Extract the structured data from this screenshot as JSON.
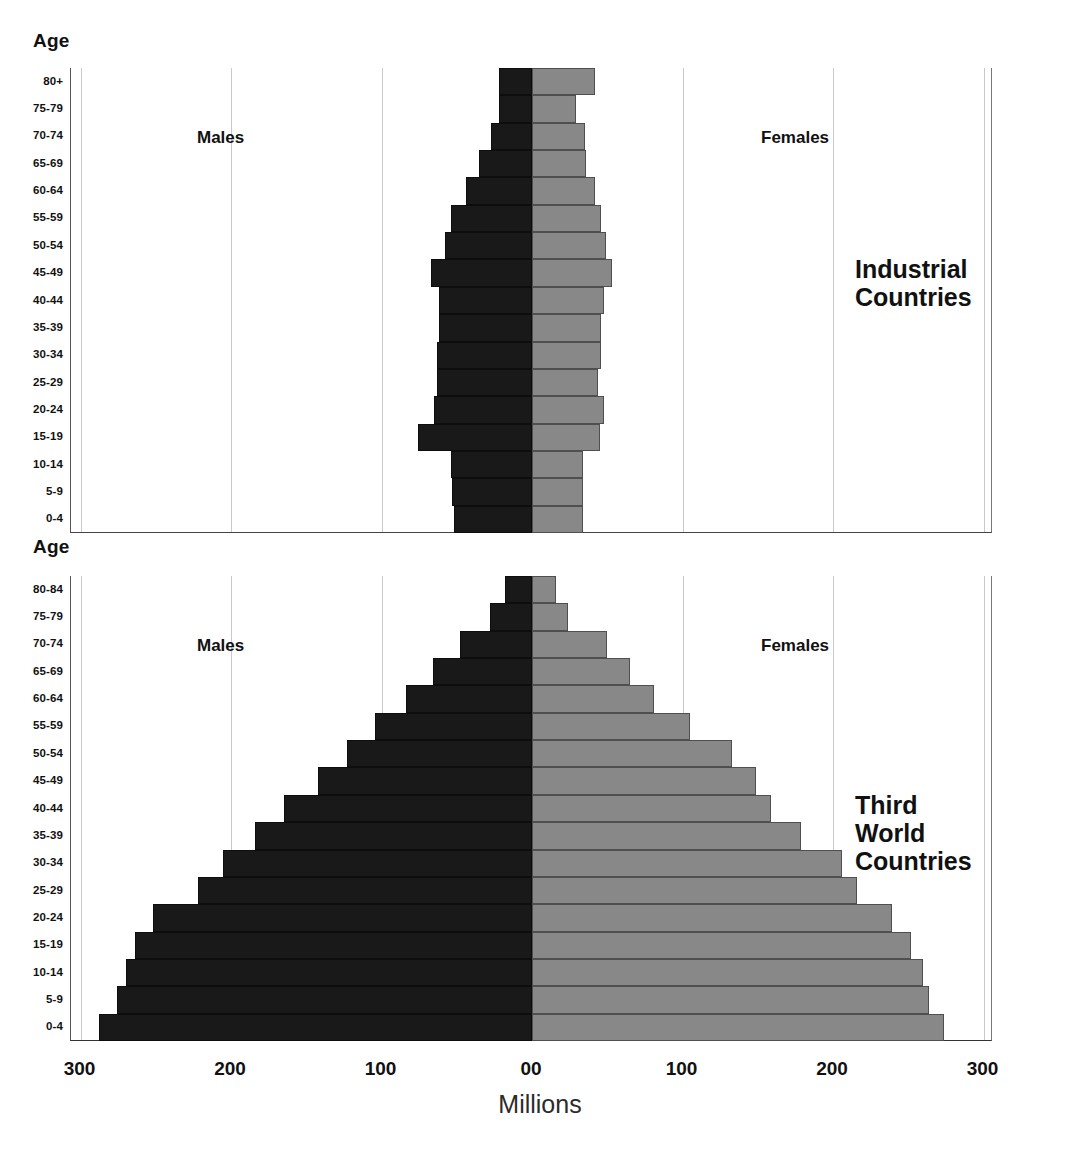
{
  "figure": {
    "axis_title": "Millions",
    "axis_label_age": "Age",
    "series_label_males": "Males",
    "series_label_females": "Females",
    "colors": {
      "male": "#191919",
      "female": "#888888",
      "grid": "#c9c9c9",
      "text": "#111111"
    }
  },
  "x_axis": {
    "ticks": [
      "300",
      "200",
      "100",
      "00",
      "100",
      "200",
      "300"
    ],
    "tick_values": [
      -300,
      -200,
      -100,
      0,
      100,
      200,
      300
    ],
    "min": -306,
    "max": 306,
    "unit": "Millions"
  },
  "panels": [
    {
      "id": "industrial",
      "caption": "Industrial\nCountries",
      "age_label": "Age",
      "males_label": "Males",
      "females_label": "Females",
      "age_groups": [
        "80+",
        "75-79",
        "70-74",
        "65-69",
        "60-64",
        "55-59",
        "50-54",
        "45-49",
        "40-44",
        "35-39",
        "30-34",
        "25-29",
        "20-24",
        "15-19",
        "10-14",
        "5-9",
        "0-4"
      ],
      "males": [
        22,
        22,
        27,
        35,
        44,
        54,
        58,
        67,
        62,
        62,
        63,
        63,
        65,
        76,
        54,
        53,
        52
      ],
      "females": [
        42,
        29,
        35,
        36,
        42,
        46,
        49,
        53,
        48,
        46,
        46,
        44,
        48,
        45,
        34,
        34,
        34
      ]
    },
    {
      "id": "third-world",
      "caption": "Third World\nCountries",
      "age_label": "Age",
      "males_label": "Males",
      "females_label": "Females",
      "age_groups": [
        "80-84",
        "75-79",
        "70-74",
        "65-69",
        "60-64",
        "55-59",
        "50-54",
        "45-49",
        "40-44",
        "35-39",
        "30-34",
        "25-29",
        "20-24",
        "15-19",
        "10-14",
        "5-9",
        "0-4"
      ],
      "males": [
        18,
        28,
        48,
        66,
        84,
        104,
        123,
        142,
        165,
        184,
        205,
        222,
        252,
        264,
        270,
        276,
        288
      ],
      "females": [
        16,
        24,
        50,
        65,
        81,
        105,
        133,
        149,
        159,
        179,
        206,
        216,
        239,
        252,
        260,
        264,
        274
      ]
    }
  ],
  "chart_data": {
    "type": "bar",
    "chart_kind": "population-pyramid",
    "title": "",
    "xlabel": "Millions",
    "ylabel": "Age",
    "xlim": [
      -306,
      306
    ],
    "xticks": [
      -300,
      -200,
      -100,
      0,
      100,
      200,
      300
    ],
    "xticklabels": [
      "300",
      "200",
      "100",
      "00",
      "100",
      "200",
      "300"
    ],
    "grid": true,
    "legend": [
      "Males",
      "Females"
    ],
    "legend_position": "in-plot",
    "panels": [
      {
        "name": "Industrial Countries",
        "categories": [
          "80+",
          "75-79",
          "70-74",
          "65-69",
          "60-64",
          "55-59",
          "50-54",
          "45-49",
          "40-44",
          "35-39",
          "30-34",
          "25-29",
          "20-24",
          "15-19",
          "10-14",
          "5-9",
          "0-4"
        ],
        "series": [
          {
            "name": "Males",
            "direction": "left",
            "values": [
              22,
              22,
              27,
              35,
              44,
              54,
              58,
              67,
              62,
              62,
              63,
              63,
              65,
              76,
              54,
              53,
              52
            ]
          },
          {
            "name": "Females",
            "direction": "right",
            "values": [
              42,
              29,
              35,
              36,
              42,
              46,
              49,
              53,
              48,
              46,
              46,
              44,
              48,
              45,
              34,
              34,
              34
            ]
          }
        ]
      },
      {
        "name": "Third World Countries",
        "categories": [
          "80-84",
          "75-79",
          "70-74",
          "65-69",
          "60-64",
          "55-59",
          "50-54",
          "45-49",
          "40-44",
          "35-39",
          "30-34",
          "25-29",
          "20-24",
          "15-19",
          "10-14",
          "5-9",
          "0-4"
        ],
        "series": [
          {
            "name": "Males",
            "direction": "left",
            "values": [
              18,
              28,
              48,
              66,
              84,
              104,
              123,
              142,
              165,
              184,
              205,
              222,
              252,
              264,
              270,
              276,
              288
            ]
          },
          {
            "name": "Females",
            "direction": "right",
            "values": [
              16,
              24,
              50,
              65,
              81,
              105,
              133,
              149,
              159,
              179,
              206,
              216,
              239,
              252,
              260,
              264,
              274
            ]
          }
        ]
      }
    ]
  }
}
